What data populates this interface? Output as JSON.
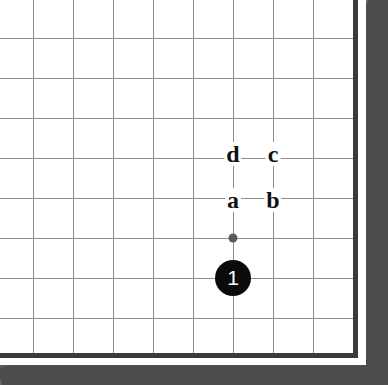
{
  "figure": {
    "title": "Go board corner diagram",
    "board_corner": "bottom-right",
    "background_color": "#ffffff",
    "grid_line_color": "#8e8e8e",
    "board_edge_color": "#3a3a3a",
    "paper_margin_color": "#5c5c5c",
    "stone_black_color": "#0b0b0b",
    "stone_label_color": "#ffffff",
    "star_point_color": "#5a5a5a",
    "letter_color": "#111111"
  },
  "geometry": {
    "width": 388,
    "height": 385,
    "board_width": 366,
    "board_height": 365,
    "grid_spacing": 40,
    "grid_origin_x": 33,
    "grid_origin_y": 38,
    "edge_x": 353,
    "edge_y": 353,
    "vertical_lines_x": [
      33,
      73,
      113,
      153,
      193,
      233,
      273,
      313
    ],
    "horizontal_lines_y": [
      38,
      78,
      118,
      158,
      198,
      238,
      278,
      318
    ],
    "edge_thickness": 5,
    "paper_margin_right_width": 22,
    "paper_margin_bottom_height": 20
  },
  "star_points": [
    {
      "name": "hoshi",
      "x": 233,
      "y": 238,
      "size": 9
    }
  ],
  "stones": [
    {
      "name": "stone-1",
      "color": "black",
      "label": "1",
      "x": 233,
      "y": 278,
      "diameter": 36
    }
  ],
  "letter_markers": [
    {
      "name": "marker-d",
      "label": "d",
      "x": 233,
      "y": 154
    },
    {
      "name": "marker-c",
      "label": "c",
      "x": 273,
      "y": 154
    },
    {
      "name": "marker-a",
      "label": "a",
      "x": 233,
      "y": 200
    },
    {
      "name": "marker-b",
      "label": "b",
      "x": 273,
      "y": 200
    }
  ]
}
